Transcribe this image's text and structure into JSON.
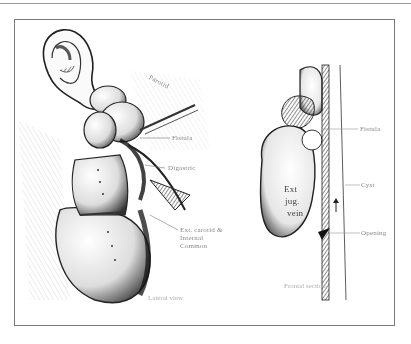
{
  "figure": {
    "left_panel": {
      "labels": {
        "parotid": "Parotid",
        "fistula": "Fistula",
        "digastric": "Digastric",
        "carotid_external": "Ext. carotid &",
        "carotid_internal": "Internal",
        "carotid_common": "Common"
      },
      "caption": "Lateral view"
    },
    "right_panel": {
      "vein_label_line1": "Ext",
      "vein_label_line2": "jug.",
      "vein_label_line3": "vein",
      "labels": {
        "top": "Fistula",
        "middle": "Cyst",
        "bottom": "Opening"
      },
      "caption": "Frontal section"
    },
    "colors": {
      "ink": "#1a1a1a",
      "frame": "#7a7a7a",
      "label": "#8a8a8a"
    }
  }
}
